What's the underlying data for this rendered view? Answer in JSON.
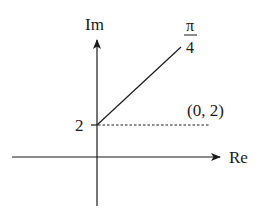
{
  "diagram": {
    "type": "complex-plane",
    "axes": {
      "horizontal_label": "Re",
      "vertical_label": "Im"
    },
    "tick_label": "2",
    "point_label": "(0, 2)",
    "angle_label": {
      "numerator": "π",
      "denominator": "4"
    },
    "ray": {
      "start": [
        0,
        2
      ],
      "angle": "π/4"
    },
    "colors": {
      "stroke": "#1a1a1a",
      "background": "#ffffff"
    }
  }
}
